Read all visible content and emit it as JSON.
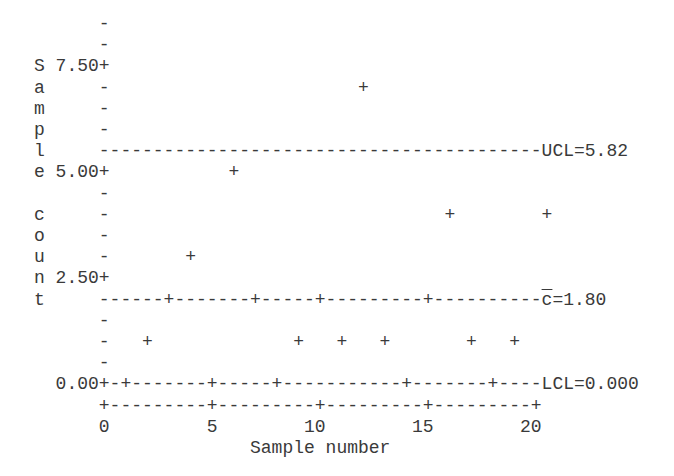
{
  "chart_data": {
    "type": "scatter",
    "title": "",
    "subtitle": "c chart (character plot)",
    "xlabel": "Sample number",
    "ylabel": "Sample count",
    "xlim": [
      0,
      20
    ],
    "ylim": [
      0,
      8
    ],
    "x_ticks": [
      "0",
      "5",
      "10",
      "15",
      "20"
    ],
    "y_ticks": [
      "0.00",
      "2.50",
      "5.00",
      "7.50"
    ],
    "grid": false,
    "legend": null,
    "x": [
      1,
      2,
      3,
      4,
      5,
      6,
      7,
      8,
      9,
      10,
      11,
      12,
      13,
      14,
      15,
      16,
      17,
      18,
      19,
      20
    ],
    "values": [
      0,
      1,
      2,
      3,
      0,
      5,
      2,
      0,
      1,
      2,
      1,
      7,
      1,
      0,
      2,
      4,
      1,
      0,
      1,
      4
    ],
    "control_lines": [
      {
        "name": "UCL",
        "label": "UCL=5.82",
        "value": 5.82
      },
      {
        "name": "center",
        "label": "c̄=1.80",
        "value": 1.8
      },
      {
        "name": "LCL",
        "label": "LCL=0.000",
        "value": 0.0
      }
    ],
    "annotations": [
      "UCL=5.82",
      "c̄=1.80",
      "LCL=0.000"
    ]
  },
  "plot": {
    "char_width": 10.8,
    "row_height": 21.2,
    "origin_x": 34,
    "origin_y": 14,
    "text_color": "#3a3a3a",
    "rows": [
      "      -",
      "      -",
      "S 7.50+",
      "a     -",
      "m     -",
      "p     -",
      "l     -----------------------------------------UCL=5.82",
      "e 5.00+",
      "      -",
      "c     -",
      "o     -",
      "u     -",
      "n 2.50+",
      "t     -----------------------------------------",
      "      -",
      "      -",
      "      -",
      "  0.00+----------------------------------------LCL=0.000",
      "      +---------+---------+---------+---------+",
      "      0         5        10        15        20",
      "                    Sample number"
    ],
    "center_label": {
      "row": 13,
      "col": 47,
      "text": "c",
      "rest": "=1.80"
    },
    "points": [
      {
        "sample": 1,
        "value": 0,
        "row": 17,
        "col": 8
      },
      {
        "sample": 2,
        "value": 1,
        "row": 15,
        "col": 10
      },
      {
        "sample": 3,
        "value": 2,
        "row": 13,
        "col": 12
      },
      {
        "sample": 4,
        "value": 3,
        "row": 11,
        "col": 14
      },
      {
        "sample": 5,
        "value": 0,
        "row": 17,
        "col": 16
      },
      {
        "sample": 6,
        "value": 5,
        "row": 7,
        "col": 18
      },
      {
        "sample": 7,
        "value": 2,
        "row": 13,
        "col": 20
      },
      {
        "sample": 8,
        "value": 0,
        "row": 17,
        "col": 22
      },
      {
        "sample": 9,
        "value": 1,
        "row": 15,
        "col": 24
      },
      {
        "sample": 10,
        "value": 2,
        "row": 13,
        "col": 26
      },
      {
        "sample": 11,
        "value": 1,
        "row": 15,
        "col": 28
      },
      {
        "sample": 12,
        "value": 7,
        "row": 3,
        "col": 30
      },
      {
        "sample": 13,
        "value": 1,
        "row": 15,
        "col": 32
      },
      {
        "sample": 14,
        "value": 0,
        "row": 17,
        "col": 34
      },
      {
        "sample": 15,
        "value": 2,
        "row": 13,
        "col": 36
      },
      {
        "sample": 16,
        "value": 4,
        "row": 9,
        "col": 38
      },
      {
        "sample": 17,
        "value": 1,
        "row": 15,
        "col": 40
      },
      {
        "sample": 18,
        "value": 0,
        "row": 17,
        "col": 42
      },
      {
        "sample": 19,
        "value": 1,
        "row": 15,
        "col": 44
      },
      {
        "sample": 20,
        "value": 4,
        "row": 9,
        "col": 47
      }
    ],
    "point_glyph": "+"
  }
}
